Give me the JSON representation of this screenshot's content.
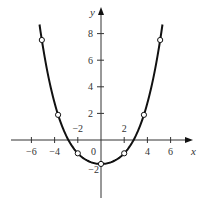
{
  "chart_data": {
    "type": "line",
    "title": "",
    "xlabel": "x",
    "ylabel": "y",
    "xlim": [
      -7.8,
      8
    ],
    "ylim": [
      -4.2,
      10
    ],
    "grid": false,
    "x_ticks": [
      -6,
      -4,
      -2,
      2,
      4,
      6
    ],
    "x_tick_labels": [
      "−6",
      "−4",
      "−2",
      "2",
      "4",
      "6"
    ],
    "y_ticks": [
      2,
      4,
      6,
      8
    ],
    "y_tick_labels": [
      "2",
      "4",
      "6",
      "8"
    ],
    "y_extra_labels": [
      {
        "text": "−2",
        "value": -2
      }
    ],
    "origin_label": "0",
    "curve": {
      "description": "U-shaped even function, approx f(x)=0.0072x^4+0.171x^2-1.8",
      "coefficients": {
        "x4": 0.0072,
        "x2": 0.171,
        "x0": -1.8
      },
      "x_range": [
        -5.3,
        5.3
      ]
    },
    "points": [
      {
        "x": -5.1,
        "y": 7,
        "style": "open"
      },
      {
        "x": -3.7,
        "y": 2,
        "style": "open"
      },
      {
        "x": -2,
        "y": -1,
        "style": "open"
      },
      {
        "x": 0,
        "y": -1.8,
        "style": "open"
      },
      {
        "x": 2,
        "y": -1,
        "style": "open"
      },
      {
        "x": 3.7,
        "y": 2,
        "style": "open"
      },
      {
        "x": 5.1,
        "y": 7,
        "style": "open"
      }
    ],
    "colors": {
      "curve": "#111111",
      "axis": "#333333",
      "point_fill": "#ffffff"
    }
  }
}
